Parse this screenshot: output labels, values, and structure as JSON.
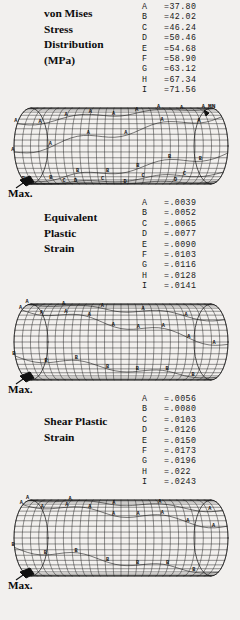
{
  "figure": {
    "background": "#f2f0ee",
    "ink": "#111111",
    "max_label": "Max.",
    "marker_mn": "MN",
    "marker_mx": "MX"
  },
  "panels": [
    {
      "id": "von-mises-stress",
      "title_lines": [
        "von Mises",
        "Stress",
        "Distribution",
        "(MPa)"
      ],
      "legend": [
        {
          "key": "A",
          "value": "=37.80"
        },
        {
          "key": "B",
          "value": "=42.02"
        },
        {
          "key": "C",
          "value": "=46.24"
        },
        {
          "key": "D",
          "value": "=50.46"
        },
        {
          "key": "E",
          "value": "=54.68"
        },
        {
          "key": "F",
          "value": "=58.90"
        },
        {
          "key": "G",
          "value": "=63.12"
        },
        {
          "key": "H",
          "value": "=67.34"
        },
        {
          "key": "I",
          "value": "=71.56"
        }
      ],
      "max_label": "Max."
    },
    {
      "id": "equivalent-plastic-strain",
      "title_lines": [
        "Equivalent",
        "Plastic",
        "Strain"
      ],
      "legend": [
        {
          "key": "A",
          "value": "=.0039"
        },
        {
          "key": "B",
          "value": "=.0052"
        },
        {
          "key": "C",
          "value": "=.0065"
        },
        {
          "key": "D",
          "value": "=.0077"
        },
        {
          "key": "E",
          "value": "=.0090"
        },
        {
          "key": "F",
          "value": "=.0103"
        },
        {
          "key": "G",
          "value": "=.0116"
        },
        {
          "key": "H",
          "value": "=.0128"
        },
        {
          "key": "I",
          "value": "=.0141"
        }
      ],
      "max_label": "Max."
    },
    {
      "id": "shear-plastic-strain",
      "title_lines": [
        "Shear Plastic",
        "Strain"
      ],
      "legend": [
        {
          "key": "A",
          "value": "=.0056"
        },
        {
          "key": "B",
          "value": "=.0080"
        },
        {
          "key": "C",
          "value": "=.0103"
        },
        {
          "key": "D",
          "value": "=.0126"
        },
        {
          "key": "E",
          "value": "=.0150"
        },
        {
          "key": "F",
          "value": "=.0173"
        },
        {
          "key": "G",
          "value": "=.0196"
        },
        {
          "key": "H",
          "value": "=.022"
        },
        {
          "key": "I",
          "value": "=.0243"
        }
      ],
      "max_label": "Max."
    }
  ],
  "chart_data": {
    "type": "contour",
    "geometry": "cylinder",
    "contour_label_scheme": "A-I letters mark iso-value bands on the mesh",
    "plots": [
      {
        "name": "von Mises Stress Distribution",
        "units": "MPa",
        "levels": [
          37.8,
          42.02,
          46.24,
          50.46,
          54.68,
          58.9,
          63.12,
          67.34,
          71.56
        ],
        "level_keys": [
          "A",
          "B",
          "C",
          "D",
          "E",
          "F",
          "G",
          "H",
          "I"
        ],
        "annotations": [
          "MN",
          "Max."
        ],
        "contour_labels_visible": [
          "A",
          "B",
          "C",
          "D",
          "E"
        ]
      },
      {
        "name": "Equivalent Plastic Strain",
        "units": "",
        "levels": [
          0.0039,
          0.0052,
          0.0065,
          0.0077,
          0.009,
          0.0103,
          0.0116,
          0.0128,
          0.0141
        ],
        "level_keys": [
          "A",
          "B",
          "C",
          "D",
          "E",
          "F",
          "G",
          "H",
          "I"
        ],
        "annotations": [
          "Max."
        ],
        "contour_labels_visible": [
          "A",
          "B",
          "C"
        ]
      },
      {
        "name": "Shear Plastic Strain",
        "units": "",
        "levels": [
          0.0056,
          0.008,
          0.0103,
          0.0126,
          0.015,
          0.0173,
          0.0196,
          0.022,
          0.0243
        ],
        "level_keys": [
          "A",
          "B",
          "C",
          "D",
          "E",
          "F",
          "G",
          "H",
          "I"
        ],
        "annotations": [
          "Max."
        ],
        "contour_labels_visible": [
          "A",
          "B",
          "C"
        ]
      }
    ]
  }
}
